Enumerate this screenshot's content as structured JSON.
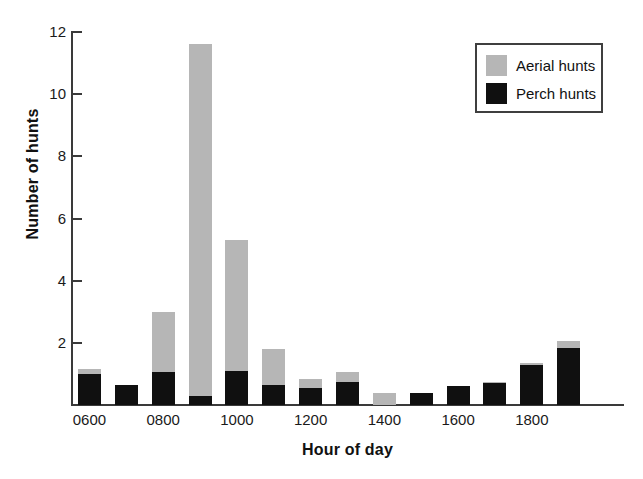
{
  "chart_data": {
    "type": "bar",
    "subtype": "stacked-bar",
    "title": "",
    "xlabel": "Hour of day",
    "ylabel": "Number of hunts",
    "categories": [
      "0600",
      "0700",
      "0800",
      "0900",
      "1000",
      "1100",
      "1200",
      "1300",
      "1400",
      "1500",
      "1600",
      "1700",
      "1800",
      "1900",
      "2000"
    ],
    "x_tick_labels": [
      "0600",
      "0800",
      "1000",
      "1200",
      "1400",
      "1600",
      "1800"
    ],
    "x_tick_categories": [
      "0600",
      "0800",
      "1000",
      "1200",
      "1400",
      "1600",
      "1800"
    ],
    "y_tick_labels": [
      "2",
      "4",
      "6",
      "8",
      "10",
      "12"
    ],
    "y_ticks": [
      2,
      4,
      6,
      8,
      10,
      12
    ],
    "ylim": [
      0,
      12
    ],
    "xlim_note": "15 hourly bins from 0600 to 2000",
    "grid": false,
    "legend_position": "top-right",
    "series": [
      {
        "name": "Perch hunts",
        "color": "#101010",
        "values": [
          1.0,
          0.65,
          1.05,
          0.3,
          1.1,
          0.65,
          0.55,
          0.75,
          0.0,
          0.4,
          0.6,
          0.7,
          1.3,
          1.85,
          0.0
        ]
      },
      {
        "name": "Aerial hunts",
        "color": "#b6b6b6",
        "values": [
          0.15,
          0.0,
          1.95,
          11.3,
          4.2,
          1.15,
          0.3,
          0.3,
          0.4,
          0.0,
          0.0,
          0.05,
          0.05,
          0.2,
          0.0
        ]
      }
    ],
    "totals": [
      1.15,
      0.65,
      3.0,
      11.6,
      5.3,
      1.8,
      0.85,
      1.05,
      0.4,
      0.4,
      0.6,
      0.75,
      1.35,
      2.05,
      0.0
    ]
  },
  "legend": {
    "entries": [
      {
        "label": "Aerial hunts",
        "swatch_color": "#b6b6b6",
        "swatch_name": "aerial-hunts-swatch"
      },
      {
        "label": "Perch hunts",
        "swatch_color": "#101010",
        "swatch_name": "perch-hunts-swatch"
      }
    ]
  },
  "axes": {
    "y_title": "Number of hunts",
    "x_title": "Hour of day"
  }
}
